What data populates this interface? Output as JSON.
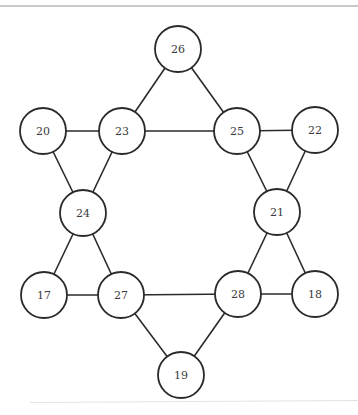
{
  "diagram": {
    "type": "graph",
    "node_radius": 23,
    "colors": {
      "stroke": "#2a2a2a",
      "fill": "#ffffff",
      "label": "#3a3a3a"
    },
    "nodes": [
      {
        "id": "26",
        "label": "26",
        "x": 178,
        "y": 49
      },
      {
        "id": "20",
        "label": "20",
        "x": 43,
        "y": 131
      },
      {
        "id": "23",
        "label": "23",
        "x": 122,
        "y": 131
      },
      {
        "id": "25",
        "label": "25",
        "x": 237,
        "y": 131
      },
      {
        "id": "22",
        "label": "22",
        "x": 315,
        "y": 130
      },
      {
        "id": "24",
        "label": "24",
        "x": 83,
        "y": 213
      },
      {
        "id": "21",
        "label": "21",
        "x": 277,
        "y": 212
      },
      {
        "id": "17",
        "label": "17",
        "x": 44,
        "y": 295
      },
      {
        "id": "27",
        "label": "27",
        "x": 121,
        "y": 295
      },
      {
        "id": "28",
        "label": "28",
        "x": 238,
        "y": 294
      },
      {
        "id": "18",
        "label": "18",
        "x": 315,
        "y": 294
      },
      {
        "id": "19",
        "label": "19",
        "x": 181,
        "y": 375
      }
    ],
    "edges": [
      [
        "26",
        "23"
      ],
      [
        "26",
        "25"
      ],
      [
        "20",
        "23"
      ],
      [
        "23",
        "25"
      ],
      [
        "25",
        "22"
      ],
      [
        "20",
        "24"
      ],
      [
        "23",
        "24"
      ],
      [
        "25",
        "21"
      ],
      [
        "22",
        "21"
      ],
      [
        "24",
        "17"
      ],
      [
        "24",
        "27"
      ],
      [
        "21",
        "28"
      ],
      [
        "21",
        "18"
      ],
      [
        "17",
        "27"
      ],
      [
        "27",
        "28"
      ],
      [
        "28",
        "18"
      ],
      [
        "27",
        "19"
      ],
      [
        "28",
        "19"
      ]
    ]
  }
}
